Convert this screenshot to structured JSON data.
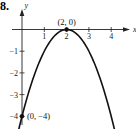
{
  "problem_number": "8.",
  "chart_data": {
    "type": "line",
    "title": "",
    "function": "y = -(x - 2)^2",
    "xlabel": "x",
    "ylabel": "y",
    "x_ticks": [
      "1",
      "2",
      "3",
      "4"
    ],
    "y_ticks": [
      "-1",
      "-2",
      "-3",
      "-4"
    ],
    "xlim": [
      -0.2,
      5
    ],
    "ylim": [
      -4.5,
      1.2
    ],
    "grid": false,
    "series": [
      {
        "name": "parabola",
        "x": [
          -0.15,
          0,
          0.5,
          1,
          1.5,
          2,
          2.5,
          3,
          3.5,
          4,
          4.15
        ],
        "y": [
          -4.62,
          -4,
          -2.25,
          -1,
          -0.25,
          0,
          -0.25,
          -1,
          -2.25,
          -4,
          -4.62
        ]
      }
    ],
    "points": [
      {
        "x": 2,
        "y": 0,
        "label": "(2, 0)"
      },
      {
        "x": 0,
        "y": -4,
        "label": "(0, −4)"
      }
    ]
  }
}
